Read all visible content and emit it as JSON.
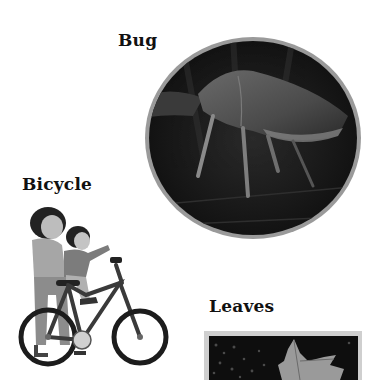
{
  "labels": {
    "bug": "Bug",
    "bicycle": "Bicycle",
    "leaves": "Leaves"
  },
  "images": {
    "bug": {
      "subject": "stink-bug-on-leaf",
      "frame": "circle",
      "frame_color": "#9a9a9a"
    },
    "bicycle": {
      "subject": "adult-and-child-on-bicycle",
      "frame": "none"
    },
    "leaves": {
      "subject": "maple-leaf-on-dark-background",
      "frame": "rectangle",
      "frame_color": "#cfcfcf"
    }
  }
}
